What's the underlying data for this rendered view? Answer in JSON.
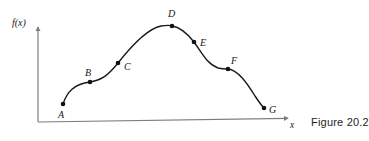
{
  "figure": {
    "caption": "Figure 20.2",
    "axes": {
      "y_label": "f(x)",
      "x_label": "x",
      "axis_color": "#7d7d7d",
      "origin": {
        "x": 38,
        "y": 122
      },
      "y_axis_top": {
        "x": 38,
        "y": 24
      },
      "x_axis_end": {
        "x": 294,
        "y": 118
      }
    },
    "curve": {
      "color": "#1a1a1a",
      "stroke_width": 1.4,
      "point_color": "#111111",
      "point_radius": 2.3
    }
  },
  "chart_data": {
    "type": "line",
    "title": "",
    "xlabel": "x",
    "ylabel": "f(x)",
    "grid": false,
    "legend": null,
    "axis_ranges": {
      "x": [
        38,
        294
      ],
      "y": [
        24,
        122
      ]
    },
    "labeled_points": [
      {
        "label": "A",
        "x": 63,
        "y": 104,
        "label_x": 58,
        "label_y": 110
      },
      {
        "label": "B",
        "x": 90,
        "y": 82,
        "label_x": 85,
        "label_y": 68
      },
      {
        "label": "C",
        "x": 118,
        "y": 63,
        "label_x": 124,
        "label_y": 62
      },
      {
        "label": "D",
        "x": 172,
        "y": 26,
        "label_x": 168,
        "label_y": 9
      },
      {
        "label": "E",
        "x": 194,
        "y": 42,
        "label_x": 200,
        "label_y": 38
      },
      {
        "label": "F",
        "x": 228,
        "y": 69,
        "label_x": 231,
        "label_y": 56
      },
      {
        "label": "G",
        "x": 264,
        "y": 108,
        "label_x": 269,
        "label_y": 105
      }
    ],
    "curve_path": "M 63 104 C 67 92, 74 84, 90 82 C 103 80, 109 74, 118 63 C 129 49, 146 29, 161 26 C 168 25, 170 25, 172 26 C 179 27, 187 33, 194 42 C 202 53, 207 64, 218 68 C 222 69, 225 69, 228 69 C 238 70, 247 83, 255 96 C 259 102, 262 106, 264 108"
  }
}
